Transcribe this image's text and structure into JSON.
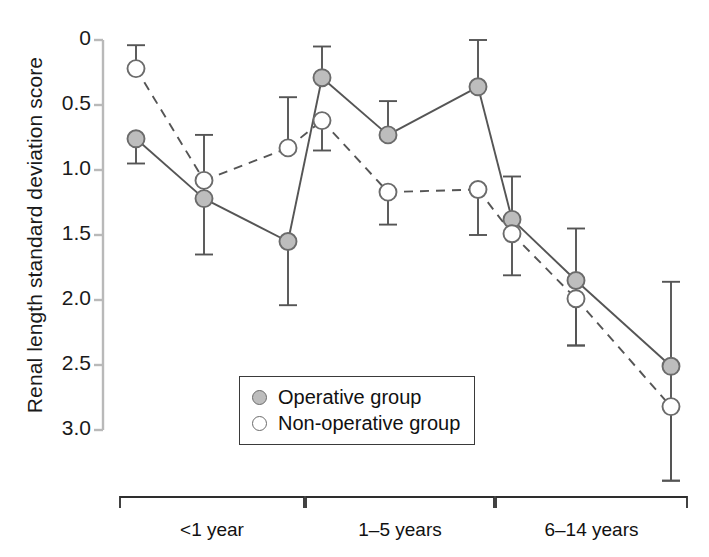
{
  "chart_data": {
    "type": "line",
    "title": "",
    "xlabel": "",
    "ylabel": "Renal length standard deviation score",
    "ylim": [
      0,
      3.0
    ],
    "y_inverted": true,
    "grid": false,
    "yticks": [
      "0",
      "0.5",
      "1.0",
      "1.5",
      "2.0",
      "2.5",
      "3.0"
    ],
    "ytick_values": [
      0,
      0.5,
      1.0,
      1.5,
      2.0,
      2.5,
      3.0
    ],
    "categories": [
      "<1 year",
      "1–5 years",
      "6–14 years"
    ],
    "group_brackets": [
      {
        "label": "<1 year"
      },
      {
        "label": "1–5 years"
      },
      {
        "label": "6–14 years"
      }
    ],
    "x_positions": [
      136,
      204,
      288,
      322,
      388,
      478,
      512,
      576,
      671
    ],
    "legend": {
      "position": "lower-center",
      "entries": [
        {
          "name": "Operative group",
          "marker": "filled-circle",
          "line": "solid"
        },
        {
          "name": "Non-operative group",
          "marker": "open-circle",
          "line": "dashed"
        }
      ]
    },
    "series": [
      {
        "name": "Operative group",
        "marker": "filled-circle",
        "line": "solid",
        "points": [
          {
            "group": "<1 year",
            "x": 136,
            "y": 0.76,
            "err_low": 0.76,
            "err_high": 0.95
          },
          {
            "group": "<1 year",
            "x": 204,
            "y": 1.22,
            "err_low": 0.73,
            "err_high": 1.65
          },
          {
            "group": "<1 year",
            "x": 288,
            "y": 1.55,
            "err_low": 1.55,
            "err_high": 2.04
          },
          {
            "group": "1–5 years",
            "x": 322,
            "y": 0.29,
            "err_low": 0.05,
            "err_high": 0.29
          },
          {
            "group": "1–5 years",
            "x": 388,
            "y": 0.73,
            "err_low": 0.47,
            "err_high": 0.73
          },
          {
            "group": "1–5 years",
            "x": 478,
            "y": 0.36,
            "err_low": 0.0,
            "err_high": 0.36
          },
          {
            "group": "6–14 years",
            "x": 512,
            "y": 1.38,
            "err_low": 1.05,
            "err_high": 1.38
          },
          {
            "group": "6–14 years",
            "x": 576,
            "y": 1.85,
            "err_low": 1.45,
            "err_high": 2.35
          },
          {
            "group": "6–14 years",
            "x": 671,
            "y": 2.51,
            "err_low": 1.86,
            "err_high": 3.39
          }
        ]
      },
      {
        "name": "Non-operative group",
        "marker": "open-circle",
        "line": "dashed",
        "points": [
          {
            "group": "<1 year",
            "x": 136,
            "y": 0.22,
            "err_low": 0.04,
            "err_high": 0.22
          },
          {
            "group": "<1 year",
            "x": 204,
            "y": 1.08,
            "err_low": 1.08,
            "err_high": 1.08
          },
          {
            "group": "<1 year",
            "x": 288,
            "y": 0.83,
            "err_low": 0.44,
            "err_high": 0.83
          },
          {
            "group": "1–5 years",
            "x": 322,
            "y": 0.62,
            "err_low": 0.62,
            "err_high": 0.85
          },
          {
            "group": "1–5 years",
            "x": 388,
            "y": 1.17,
            "err_low": 1.17,
            "err_high": 1.42
          },
          {
            "group": "1–5 years",
            "x": 478,
            "y": 1.15,
            "err_low": 1.15,
            "err_high": 1.5
          },
          {
            "group": "6–14 years",
            "x": 512,
            "y": 1.49,
            "err_low": 1.49,
            "err_high": 1.81
          },
          {
            "group": "6–14 years",
            "x": 576,
            "y": 1.99,
            "err_low": 1.99,
            "err_high": 2.35
          },
          {
            "group": "6–14 years",
            "x": 671,
            "y": 2.82,
            "err_low": 2.82,
            "err_high": 3.39
          }
        ]
      }
    ],
    "colors": {
      "axis": "#b9b9b9",
      "line": "#555555",
      "marker_fill": "#bdbdbd",
      "marker_edge": "#6b6b6b",
      "marker_open_fill": "#ffffff",
      "text": "#111111",
      "bracket": "#2e2e2e"
    }
  }
}
